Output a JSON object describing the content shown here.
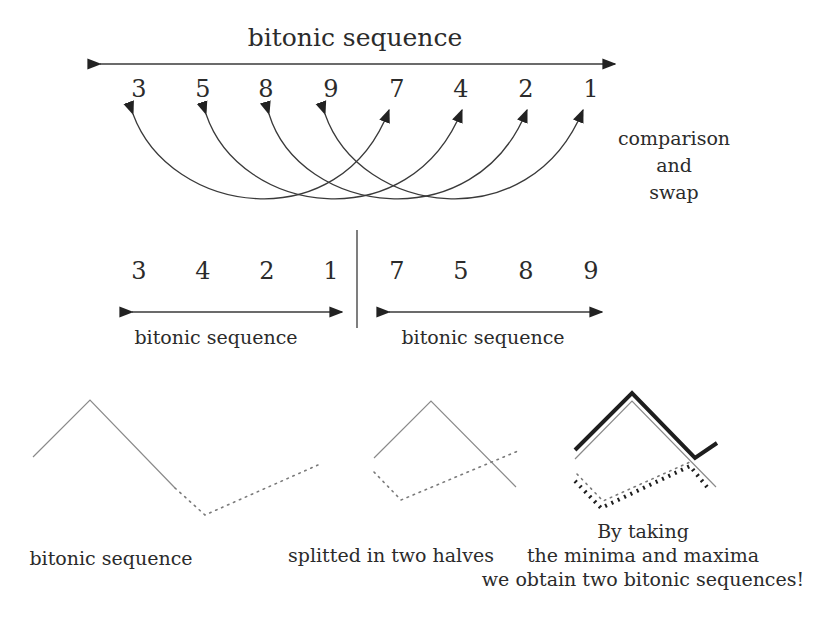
{
  "top": {
    "title": "bitonic sequence",
    "numbers": [
      "3",
      "5",
      "8",
      "9",
      "7",
      "4",
      "2",
      "1"
    ],
    "side_label": [
      "comparison",
      "and",
      "swap"
    ]
  },
  "middle": {
    "left_numbers": [
      "3",
      "4",
      "2",
      "1"
    ],
    "right_numbers": [
      "7",
      "5",
      "8",
      "9"
    ],
    "left_label": "bitonic sequence",
    "right_label": "bitonic sequence"
  },
  "bottom": {
    "caption_1": "bitonic sequence",
    "caption_2": "splitted in two halves",
    "caption_3": [
      "By taking",
      "the minima and maxima",
      "we obtain two bitonic sequences!"
    ]
  },
  "colors": {
    "ink": "#2b2b2b",
    "light_line": "#8a8a8a",
    "background": "#ffffff"
  }
}
